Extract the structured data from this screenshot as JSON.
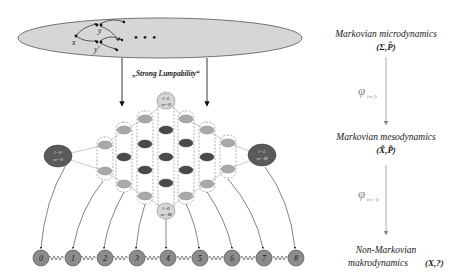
{
  "micro_level": {
    "ellipse_nodes": [
      "x",
      "y",
      "y'"
    ],
    "ellipsis": "• • •"
  },
  "projection_label": "„Strong Lumpability“",
  "lattice": {
    "top_node": {
      "l": "l=L",
      "m": "m=0"
    },
    "bottom_node": {
      "l": "l=0",
      "m": "m=M"
    },
    "left_node": {
      "l": "l=0",
      "m": "m=0"
    },
    "right_node": {
      "l": "l=L",
      "m": "m=M"
    }
  },
  "chain_nodes": [
    "0",
    "1",
    "2",
    "3",
    "4",
    "5",
    "6",
    "7",
    "8"
  ],
  "hierarchy": {
    "level1": {
      "title": "Markovian microdynamics",
      "formula": "(Σ,P̂)"
    },
    "map1": {
      "symbol": "φ",
      "subscript": "(m,l)"
    },
    "level2": {
      "title": "Markovian mesodynamics",
      "formula": "(X̃,P̃)"
    },
    "map2": {
      "symbol": "φ",
      "subscript": "(m+l)"
    },
    "level3": {
      "title_line1": "Non-Markovian",
      "title_line2": "makrodynamics",
      "formula": "(X,?)"
    }
  },
  "colors": {
    "ellipse_fill": "#d6d6d6",
    "light_node": "#a9a9a9",
    "dark_node": "#4a4a4a",
    "corner_node": "#5a5a5a",
    "chain_node": "#8c8c8c",
    "arrow_gray": "#9a9a9a"
  }
}
